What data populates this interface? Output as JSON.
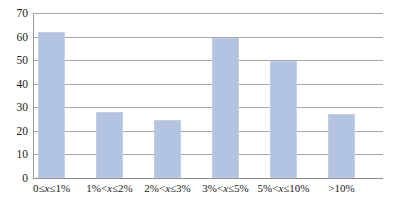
{
  "chart_data": {
    "type": "bar",
    "title": "",
    "xlabel": "",
    "ylabel": "",
    "categories": [
      "0≤x≤1%",
      "1%<x≤2%",
      "2%<x≤3%",
      "3%<x≤5%",
      "5%<x≤10%",
      ">10%"
    ],
    "values": [
      62,
      28,
      24.5,
      59.5,
      49.5,
      27
    ],
    "ylim": [
      0,
      70
    ],
    "yticks": [
      0,
      10,
      20,
      30,
      40,
      50,
      60,
      70
    ],
    "ytick_labels": [
      "0",
      "10",
      "20",
      "30",
      "40",
      "50",
      "60",
      "70"
    ],
    "grid": true,
    "legend": false,
    "series": [
      {
        "name": "",
        "values": [
          62,
          28,
          24.5,
          59.5,
          49.5,
          27
        ]
      }
    ],
    "colors": {
      "bar_fill": "#b3c4e2",
      "bar_border": "#c3cfe6",
      "gridline": "#a8a8a8",
      "axis": "#8e8e8e",
      "text": "#1a1a1a",
      "background": "#ffffff"
    }
  }
}
